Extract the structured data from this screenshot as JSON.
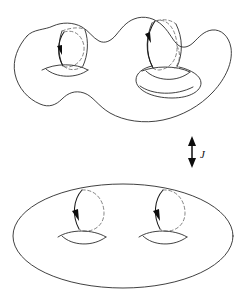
{
  "figure": {
    "background_color": "#ffffff",
    "line_color": "#2b2b2b",
    "hidden_line_color": "#6d6d6d",
    "arrow_color": "#0d0d0d",
    "map_arrow": {
      "label": "J",
      "direction": "double-headed-vertical",
      "x": 192,
      "y_top": 138,
      "y_bottom": 166,
      "label_x": 200,
      "label_y": 157
    },
    "panels": [
      {
        "id": "top-surface",
        "name": "deformed-genus-two-surface",
        "description": "Lumpy deformed genus-2 surface with two handles; left handle is a narrow tube, right handle is a larger protruding tube",
        "genus": 2,
        "bounds": {
          "x": 12,
          "y": 12,
          "width": 222,
          "height": 118
        },
        "cycles": [
          {
            "id": "top-cycle-left",
            "name": "meridian-cycle-left",
            "orientation": "counter-clockwise",
            "arrow_at": "left-side-pointing-down",
            "solid_side": "left",
            "dashed_side": "right"
          },
          {
            "id": "top-cycle-right",
            "name": "meridian-cycle-right",
            "orientation": "counter-clockwise",
            "arrow_at": "left-side-pointing-down",
            "solid_side": "left",
            "dashed_side": "right"
          }
        ],
        "holes": [
          {
            "id": "top-hole-left",
            "name": "hole-lens-left"
          },
          {
            "id": "top-hole-right",
            "name": "hole-lens-right"
          }
        ]
      },
      {
        "id": "bottom-surface",
        "name": "standard-genus-two-surface",
        "description": "Standard smooth genus-2 surface drawn as a large ellipse with two lens-shaped holes",
        "genus": 2,
        "bounds": {
          "x": 13,
          "y": 184,
          "width": 220,
          "height": 104
        },
        "cycles": [
          {
            "id": "bottom-cycle-left",
            "name": "meridian-cycle-left",
            "orientation": "counter-clockwise",
            "arrow_at": "left-side-pointing-down",
            "solid_side": "left",
            "dashed_side": "right"
          },
          {
            "id": "bottom-cycle-right",
            "name": "meridian-cycle-right",
            "orientation": "counter-clockwise",
            "arrow_at": "left-side-pointing-down",
            "solid_side": "left",
            "dashed_side": "right"
          }
        ],
        "holes": [
          {
            "id": "bottom-hole-left",
            "name": "hole-lens-left"
          },
          {
            "id": "bottom-hole-right",
            "name": "hole-lens-right"
          }
        ]
      }
    ]
  }
}
